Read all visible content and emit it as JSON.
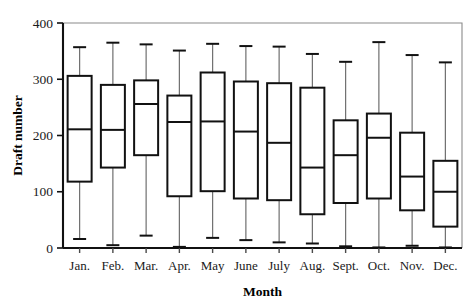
{
  "chart_data": {
    "type": "box",
    "title": "",
    "xlabel": "Month",
    "ylabel": "Draft number",
    "ylim": [
      0,
      400
    ],
    "yticks": [
      0,
      100,
      200,
      300,
      400
    ],
    "ytick_labels": [
      "0",
      "100",
      "200",
      "300",
      "400"
    ],
    "grid": false,
    "legend": "none",
    "categories": [
      "Jan.",
      "Feb.",
      "Mar.",
      "Apr.",
      "May",
      "June",
      "July",
      "Aug.",
      "Sept.",
      "Oct.",
      "Nov.",
      "Dec."
    ],
    "boxes": [
      {
        "category": "Jan.",
        "whisker_low": 16,
        "q1": 118,
        "median": 211,
        "q3": 306,
        "whisker_high": 357
      },
      {
        "category": "Feb.",
        "whisker_low": 5,
        "q1": 143,
        "median": 210,
        "q3": 290,
        "whisker_high": 365
      },
      {
        "category": "Mar.",
        "whisker_low": 22,
        "q1": 165,
        "median": 256,
        "q3": 298,
        "whisker_high": 362
      },
      {
        "category": "Apr.",
        "whisker_low": 2,
        "q1": 92,
        "median": 224,
        "q3": 271,
        "whisker_high": 351
      },
      {
        "category": "May",
        "whisker_low": 18,
        "q1": 101,
        "median": 225,
        "q3": 312,
        "whisker_high": 363
      },
      {
        "category": "June",
        "whisker_low": 14,
        "q1": 88,
        "median": 207,
        "q3": 296,
        "whisker_high": 359
      },
      {
        "category": "July",
        "whisker_low": 10,
        "q1": 85,
        "median": 187,
        "q3": 293,
        "whisker_high": 358
      },
      {
        "category": "Aug.",
        "whisker_low": 8,
        "q1": 60,
        "median": 143,
        "q3": 285,
        "whisker_high": 345
      },
      {
        "category": "Sept.",
        "whisker_low": 3,
        "q1": 80,
        "median": 165,
        "q3": 227,
        "whisker_high": 331
      },
      {
        "category": "Oct.",
        "whisker_low": 1,
        "q1": 88,
        "median": 196,
        "q3": 239,
        "whisker_high": 366
      },
      {
        "category": "Nov.",
        "whisker_low": 4,
        "q1": 67,
        "median": 127,
        "q3": 205,
        "whisker_high": 343
      },
      {
        "category": "Dec.",
        "whisker_low": 1,
        "q1": 38,
        "median": 100,
        "q3": 155,
        "whisker_high": 330
      }
    ]
  }
}
